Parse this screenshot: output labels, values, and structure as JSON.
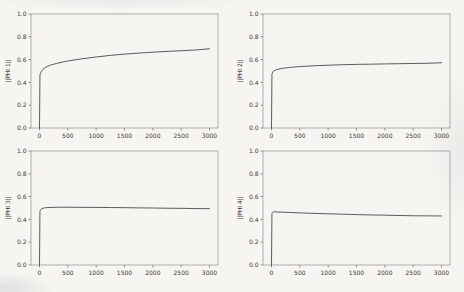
{
  "figure": {
    "background_color": "#f6f5f2",
    "spine_color": "#8f8f8d",
    "tick_color": "#6e6e6c",
    "label_color": "#3a3a38",
    "line_color": "#4a4a48",
    "rows": 2,
    "cols": 2
  },
  "chart_data": [
    {
      "type": "line",
      "title": "",
      "xlabel": "",
      "ylabel": "||PHI 1||",
      "xlim": [
        -150,
        3150
      ],
      "ylim": [
        0,
        1
      ],
      "grid": false,
      "legend": null,
      "xticks": [
        0,
        500,
        1000,
        1500,
        2000,
        2500,
        3000
      ],
      "xtick_labels": [
        "0",
        "500",
        "1000",
        "1500",
        "2000",
        "2500",
        "3000"
      ],
      "yticks": [
        0,
        0.2,
        0.4,
        0.6,
        0.8,
        1.0
      ],
      "ytick_labels": [
        "0.0",
        "0.2",
        "0.4",
        "0.6",
        "0.8",
        "1.0"
      ],
      "x": [
        0,
        8,
        15,
        25,
        40,
        60,
        100,
        150,
        200,
        300,
        400,
        500,
        750,
        1000,
        1250,
        1500,
        1750,
        2000,
        2250,
        2500,
        2750,
        3000
      ],
      "y": [
        0,
        0.465,
        0.478,
        0.49,
        0.503,
        0.515,
        0.53,
        0.543,
        0.553,
        0.566,
        0.578,
        0.588,
        0.607,
        0.623,
        0.637,
        0.648,
        0.657,
        0.665,
        0.672,
        0.678,
        0.684,
        0.695
      ]
    },
    {
      "type": "line",
      "title": "",
      "xlabel": "",
      "ylabel": "||PHI 2||",
      "xlim": [
        -150,
        3150
      ],
      "ylim": [
        0,
        1
      ],
      "grid": false,
      "legend": null,
      "xticks": [
        0,
        500,
        1000,
        1500,
        2000,
        2500,
        3000
      ],
      "xtick_labels": [
        "0",
        "500",
        "1000",
        "1500",
        "2000",
        "2500",
        "3000"
      ],
      "yticks": [
        0,
        0.2,
        0.4,
        0.6,
        0.8,
        1.0
      ],
      "ytick_labels": [
        "0.0",
        "0.2",
        "0.4",
        "0.6",
        "0.8",
        "1.0"
      ],
      "x": [
        0,
        8,
        15,
        25,
        40,
        60,
        100,
        150,
        200,
        300,
        400,
        500,
        750,
        1000,
        1250,
        1500,
        1750,
        2000,
        2250,
        2500,
        2750,
        3000
      ],
      "y": [
        0,
        0.47,
        0.483,
        0.492,
        0.5,
        0.506,
        0.513,
        0.519,
        0.524,
        0.53,
        0.535,
        0.539,
        0.546,
        0.551,
        0.555,
        0.558,
        0.56,
        0.562,
        0.564,
        0.566,
        0.568,
        0.572
      ]
    },
    {
      "type": "line",
      "title": "",
      "xlabel": "",
      "ylabel": "||PHI 3||",
      "xlim": [
        -150,
        3150
      ],
      "ylim": [
        0,
        1
      ],
      "grid": false,
      "legend": null,
      "xticks": [
        0,
        500,
        1000,
        1500,
        2000,
        2500,
        3000
      ],
      "xtick_labels": [
        "0",
        "500",
        "1000",
        "1500",
        "2000",
        "2500",
        "3000"
      ],
      "yticks": [
        0,
        0.2,
        0.4,
        0.6,
        0.8,
        1.0
      ],
      "ytick_labels": [
        "0.0",
        "0.2",
        "0.4",
        "0.6",
        "0.8",
        "1.0"
      ],
      "x": [
        0,
        8,
        15,
        25,
        40,
        60,
        100,
        150,
        200,
        300,
        400,
        500,
        750,
        1000,
        1250,
        1500,
        1750,
        2000,
        2250,
        2500,
        2750,
        3000
      ],
      "y": [
        0,
        0.468,
        0.48,
        0.488,
        0.494,
        0.498,
        0.502,
        0.504,
        0.505,
        0.506,
        0.507,
        0.507,
        0.506,
        0.505,
        0.504,
        0.503,
        0.501,
        0.5,
        0.498,
        0.497,
        0.495,
        0.494
      ]
    },
    {
      "type": "line",
      "title": "",
      "xlabel": "",
      "ylabel": "||PHI 4||",
      "xlim": [
        -150,
        3150
      ],
      "ylim": [
        0,
        1
      ],
      "grid": false,
      "legend": null,
      "xticks": [
        0,
        500,
        1000,
        1500,
        2000,
        2500,
        3000
      ],
      "xtick_labels": [
        "0",
        "500",
        "1000",
        "1500",
        "2000",
        "2500",
        "3000"
      ],
      "yticks": [
        0,
        0.2,
        0.4,
        0.6,
        0.8,
        1.0
      ],
      "ytick_labels": [
        "0.0",
        "0.2",
        "0.4",
        "0.6",
        "0.8",
        "1.0"
      ],
      "x": [
        0,
        8,
        15,
        25,
        40,
        60,
        100,
        150,
        200,
        300,
        400,
        500,
        750,
        1000,
        1250,
        1500,
        1750,
        2000,
        2250,
        2500,
        2750,
        3000
      ],
      "y": [
        0,
        0.452,
        0.46,
        0.464,
        0.467,
        0.467,
        0.465,
        0.464,
        0.463,
        0.461,
        0.459,
        0.457,
        0.453,
        0.449,
        0.446,
        0.442,
        0.439,
        0.437,
        0.434,
        0.432,
        0.431,
        0.43
      ]
    }
  ]
}
